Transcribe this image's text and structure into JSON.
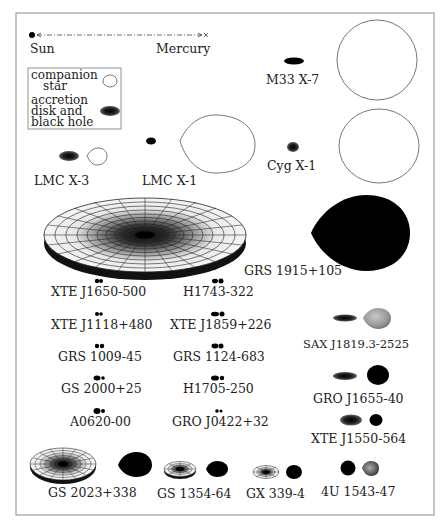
{
  "scale_bar": {
    "left_label": "Sun",
    "right_label": "Mercury"
  },
  "legend": {
    "companion_line1": "companion",
    "companion_line2": "star",
    "disk_line1": "accretion",
    "disk_line2": "disk  and",
    "disk_line3": "black hole"
  },
  "systems": [
    {
      "id": "m33x7",
      "name": "M33 X-7"
    },
    {
      "id": "lmcx3",
      "name": "LMC X-3"
    },
    {
      "id": "lmcx1",
      "name": "LMC X-1"
    },
    {
      "id": "cygx1",
      "name": "Cyg X-1"
    },
    {
      "id": "grs1915",
      "name": "GRS 1915+105"
    },
    {
      "id": "xtej1650",
      "name": "XTE J1650-500"
    },
    {
      "id": "h1743",
      "name": "H1743-322"
    },
    {
      "id": "xtej1118",
      "name": "XTE J1118+480"
    },
    {
      "id": "xtej1859",
      "name": "XTE J1859+226"
    },
    {
      "id": "grs1009",
      "name": "GRS 1009-45"
    },
    {
      "id": "grs1124",
      "name": "GRS 1124-683"
    },
    {
      "id": "gs2000",
      "name": "GS 2000+25"
    },
    {
      "id": "h1705",
      "name": "H1705-250"
    },
    {
      "id": "a0620",
      "name": "A0620-00"
    },
    {
      "id": "groj0422",
      "name": "GRO J0422+32"
    },
    {
      "id": "saxj1819",
      "name": "SAX J1819.3-2525"
    },
    {
      "id": "groj1655",
      "name": "GRO J1655-40"
    },
    {
      "id": "xtej1550",
      "name": "XTE J1550-564"
    },
    {
      "id": "gs2023",
      "name": "GS 2023+338"
    },
    {
      "id": "gs1354",
      "name": "GS 1354-64"
    },
    {
      "id": "gx339",
      "name": "GX 339-4"
    },
    {
      "id": "4u1543",
      "name": "4U 1543-47"
    }
  ],
  "colors": {
    "frame": "#8a8a8a",
    "outline": "#666666",
    "ink": "#111111",
    "gray_star": "#9a9a9a"
  }
}
